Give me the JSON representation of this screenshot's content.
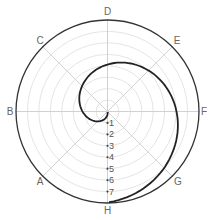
{
  "chart_data": {
    "type": "line",
    "subtype": "polar",
    "title": "",
    "angular_labels": [
      "D",
      "E",
      "F",
      "G",
      "H",
      "A",
      "B",
      "C"
    ],
    "angular_positions_deg_clockwise_from_top": [
      0,
      45,
      90,
      135,
      180,
      225,
      270,
      315
    ],
    "radial_ticks": [
      "1",
      "2",
      "3",
      "4",
      "5",
      "6",
      "7"
    ],
    "radial_range": [
      0,
      8
    ],
    "grid": true,
    "series": [
      {
        "name": "spiral",
        "description": "Spiral starting at center, looping through B, then D, E, F, G, ending at H on outer ring",
        "points": [
          {
            "direction": "center",
            "r": 0
          },
          {
            "direction": "B",
            "r": 2.2
          },
          {
            "direction": "C",
            "r": 3.2
          },
          {
            "direction": "D",
            "r": 4.1
          },
          {
            "direction": "E",
            "r": 5.0
          },
          {
            "direction": "F",
            "r": 6.0
          },
          {
            "direction": "G",
            "r": 7.0
          },
          {
            "direction": "H",
            "r": 8.0
          }
        ]
      }
    ],
    "colors": {
      "curve": "#222222",
      "outer_ring": "#333333",
      "grid": "#dddddd",
      "spokes": "#cccccc"
    }
  },
  "labels": {
    "D": "D",
    "E": "E",
    "F": "F",
    "G": "G",
    "H": "H",
    "A": "A",
    "B": "B",
    "C": "C",
    "r1": "1",
    "r2": "2",
    "r3": "3",
    "r4": "4",
    "r5": "5",
    "r6": "6",
    "r7": "7"
  }
}
